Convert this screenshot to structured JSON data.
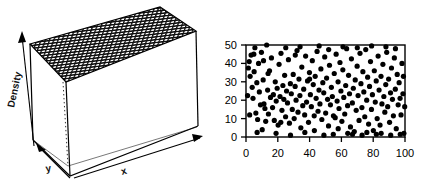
{
  "figure": {
    "title": "",
    "panels": [
      {
        "id": "density-surface-3d",
        "type": "surface-3d",
        "axis_labels": {
          "vertical": "Density",
          "depth": "y",
          "horizontal": "x"
        },
        "surface_style": "mesh-grid",
        "surface_color": "#1a1a1a",
        "box_color": "#000000",
        "hidden_edge_style": "dotted"
      },
      {
        "id": "uniform-scatter-2d",
        "type": "scatter"
      }
    ]
  },
  "chart_data": [
    {
      "type": "surface",
      "title": "",
      "xlabel": "x",
      "ylabel": "y",
      "zlabel": "Density",
      "description": "Flat uniform bivariate density surface drawn as a dark wireframe mesh forming the top face of a 3D box; density is constant across the whole x-y domain.",
      "z_constant": 1,
      "grid": true,
      "nx": 40,
      "ny": 18,
      "xlim": [
        0,
        100
      ],
      "ylim": [
        0,
        50
      ],
      "zlim": [
        0,
        1
      ]
    },
    {
      "type": "scatter",
      "title": "",
      "xlabel": "",
      "ylabel": "",
      "xlim": [
        0,
        100
      ],
      "ylim": [
        0,
        50
      ],
      "xticks": [
        0,
        20,
        40,
        60,
        80,
        100
      ],
      "yticks": [
        0,
        10,
        20,
        30,
        40,
        50
      ],
      "grid": false,
      "legend": false,
      "marker": "filled-circle",
      "marker_color": "#000000",
      "marker_size": 2.6,
      "n_points": 200,
      "points": [
        [
          1.5,
          37.5
        ],
        [
          2.0,
          41.0
        ],
        [
          2.6,
          33.0
        ],
        [
          3.2,
          44.5
        ],
        [
          3.9,
          27.0
        ],
        [
          4.4,
          21.0
        ],
        [
          5.1,
          35.5
        ],
        [
          5.6,
          48.5
        ],
        [
          6.2,
          13.0
        ],
        [
          6.8,
          29.5
        ],
        [
          7.3,
          9.5
        ],
        [
          7.9,
          40.0
        ],
        [
          8.4,
          24.5
        ],
        [
          9.1,
          17.5
        ],
        [
          9.7,
          46.0
        ],
        [
          10.2,
          4.0
        ],
        [
          10.8,
          31.0
        ],
        [
          11.3,
          18.0
        ],
        [
          11.9,
          15.5
        ],
        [
          12.4,
          8.5
        ],
        [
          13.0,
          50.0
        ],
        [
          13.6,
          25.5
        ],
        [
          14.1,
          12.5
        ],
        [
          14.8,
          36.0
        ],
        [
          15.4,
          21.5
        ],
        [
          16.0,
          43.0
        ],
        [
          16.7,
          16.0
        ],
        [
          17.2,
          23.0
        ],
        [
          17.8,
          9.0
        ],
        [
          18.4,
          30.0
        ],
        [
          19.0,
          19.5
        ],
        [
          19.6,
          26.5
        ],
        [
          20.2,
          6.5
        ],
        [
          20.8,
          39.5
        ],
        [
          21.4,
          22.0
        ],
        [
          22.0,
          45.5
        ],
        [
          22.6,
          14.5
        ],
        [
          23.2,
          28.0
        ],
        [
          23.8,
          20.5
        ],
        [
          24.3,
          33.5
        ],
        [
          24.9,
          11.0
        ],
        [
          25.5,
          25.0
        ],
        [
          26.1,
          18.5
        ],
        [
          26.7,
          42.0
        ],
        [
          27.3,
          7.5
        ],
        [
          27.9,
          29.0
        ],
        [
          28.5,
          23.5
        ],
        [
          29.1,
          15.0
        ],
        [
          29.7,
          34.0
        ],
        [
          30.3,
          10.0
        ],
        [
          30.9,
          27.5
        ],
        [
          31.5,
          20.0
        ],
        [
          32.1,
          47.0
        ],
        [
          32.7,
          13.5
        ],
        [
          33.3,
          31.5
        ],
        [
          33.9,
          22.5
        ],
        [
          34.5,
          5.0
        ],
        [
          35.1,
          38.0
        ],
        [
          35.7,
          17.0
        ],
        [
          36.3,
          26.0
        ],
        [
          36.9,
          12.0
        ],
        [
          37.5,
          44.0
        ],
        [
          38.1,
          19.0
        ],
        [
          38.7,
          30.5
        ],
        [
          39.3,
          8.0
        ],
        [
          39.9,
          35.0
        ],
        [
          40.5,
          23.0
        ],
        [
          41.1,
          16.5
        ],
        [
          41.7,
          41.5
        ],
        [
          42.3,
          28.5
        ],
        [
          42.9,
          11.5
        ],
        [
          43.5,
          33.0
        ],
        [
          44.1,
          21.0
        ],
        [
          44.7,
          46.5
        ],
        [
          45.3,
          14.0
        ],
        [
          45.9,
          25.5
        ],
        [
          46.5,
          18.0
        ],
        [
          47.1,
          37.0
        ],
        [
          47.7,
          9.5
        ],
        [
          48.3,
          29.5
        ],
        [
          48.9,
          24.0
        ],
        [
          49.5,
          43.5
        ],
        [
          50.1,
          13.0
        ],
        [
          50.7,
          32.0
        ],
        [
          51.3,
          20.5
        ],
        [
          51.9,
          6.0
        ],
        [
          52.5,
          39.0
        ],
        [
          53.1,
          17.5
        ],
        [
          53.7,
          27.0
        ],
        [
          54.3,
          22.0
        ],
        [
          54.9,
          1.5
        ],
        [
          55.5,
          34.5
        ],
        [
          56.1,
          10.5
        ],
        [
          56.7,
          45.0
        ],
        [
          57.3,
          19.5
        ],
        [
          57.9,
          30.0
        ],
        [
          58.5,
          15.5
        ],
        [
          59.1,
          40.5
        ],
        [
          59.7,
          25.0
        ],
        [
          60.3,
          8.5
        ],
        [
          60.9,
          36.5
        ],
        [
          61.5,
          21.5
        ],
        [
          62.1,
          12.5
        ],
        [
          62.7,
          28.0
        ],
        [
          63.3,
          48.0
        ],
        [
          63.9,
          17.0
        ],
        [
          64.5,
          33.5
        ],
        [
          65.1,
          23.5
        ],
        [
          65.7,
          5.5
        ],
        [
          66.3,
          42.5
        ],
        [
          66.9,
          18.5
        ],
        [
          67.5,
          26.5
        ],
        [
          68.1,
          3.0
        ],
        [
          68.7,
          31.0
        ],
        [
          69.3,
          14.5
        ],
        [
          69.9,
          38.5
        ],
        [
          70.5,
          22.5
        ],
        [
          71.1,
          9.0
        ],
        [
          71.7,
          45.5
        ],
        [
          72.3,
          29.0
        ],
        [
          72.9,
          16.0
        ],
        [
          73.5,
          35.5
        ],
        [
          74.1,
          24.5
        ],
        [
          74.7,
          11.0
        ],
        [
          75.3,
          47.5
        ],
        [
          75.9,
          20.0
        ],
        [
          76.5,
          32.5
        ],
        [
          77.1,
          7.0
        ],
        [
          77.7,
          27.5
        ],
        [
          78.3,
          41.0
        ],
        [
          78.9,
          15.0
        ],
        [
          79.5,
          23.0
        ],
        [
          80.1,
          3.5
        ],
        [
          80.7,
          36.0
        ],
        [
          81.3,
          19.0
        ],
        [
          81.9,
          30.5
        ],
        [
          82.5,
          10.0
        ],
        [
          83.1,
          44.0
        ],
        [
          83.7,
          25.5
        ],
        [
          84.3,
          6.5
        ],
        [
          84.9,
          33.0
        ],
        [
          85.5,
          18.0
        ],
        [
          86.1,
          39.5
        ],
        [
          86.7,
          22.0
        ],
        [
          87.3,
          13.5
        ],
        [
          87.9,
          28.5
        ],
        [
          88.5,
          46.0
        ],
        [
          89.1,
          16.5
        ],
        [
          89.7,
          31.5
        ],
        [
          90.3,
          8.0
        ],
        [
          90.9,
          24.0
        ],
        [
          91.5,
          37.5
        ],
        [
          92.1,
          20.5
        ],
        [
          92.7,
          11.5
        ],
        [
          93.3,
          43.0
        ],
        [
          93.9,
          26.0
        ],
        [
          94.5,
          4.5
        ],
        [
          95.1,
          34.0
        ],
        [
          95.7,
          17.5
        ],
        [
          96.3,
          29.5
        ],
        [
          96.9,
          21.0
        ],
        [
          97.5,
          12.0
        ],
        [
          98.1,
          40.0
        ],
        [
          98.7,
          23.5
        ],
        [
          99.3,
          2.0
        ],
        [
          99.8,
          16.5
        ],
        [
          1.0,
          22.5
        ],
        [
          2.3,
          12.0
        ],
        [
          4.9,
          45.0
        ],
        [
          7.0,
          2.5
        ],
        [
          11.0,
          41.5
        ],
        [
          13.9,
          34.5
        ],
        [
          18.9,
          2.0
        ],
        [
          21.9,
          8.0
        ],
        [
          25.0,
          48.5
        ],
        [
          28.0,
          1.0
        ],
        [
          31.0,
          44.5
        ],
        [
          34.0,
          49.0
        ],
        [
          37.0,
          2.5
        ],
        [
          40.0,
          31.5
        ],
        [
          43.0,
          3.5
        ],
        [
          46.0,
          49.5
        ],
        [
          49.0,
          1.0
        ],
        [
          52.0,
          47.5
        ],
        [
          55.0,
          11.5
        ],
        [
          58.0,
          4.5
        ],
        [
          61.0,
          49.0
        ],
        [
          64.0,
          2.0
        ],
        [
          67.0,
          1.5
        ],
        [
          70.0,
          48.5
        ],
        [
          73.0,
          1.0
        ],
        [
          76.0,
          2.5
        ],
        [
          79.0,
          49.5
        ],
        [
          82.0,
          1.5
        ],
        [
          85.0,
          2.0
        ],
        [
          88.0,
          49.0
        ],
        [
          91.0,
          1.0
        ],
        [
          94.0,
          48.0
        ],
        [
          97.0,
          1.5
        ],
        [
          99.0,
          33.0
        ]
      ]
    }
  ],
  "scatter_axes": {
    "xticks": [
      "0",
      "20",
      "40",
      "60",
      "80",
      "100"
    ],
    "yticks": [
      "0",
      "10",
      "20",
      "30",
      "40",
      "50"
    ]
  },
  "colors": {
    "ink": "#000000",
    "mesh": "#1a1a1a",
    "background": "#ffffff"
  }
}
